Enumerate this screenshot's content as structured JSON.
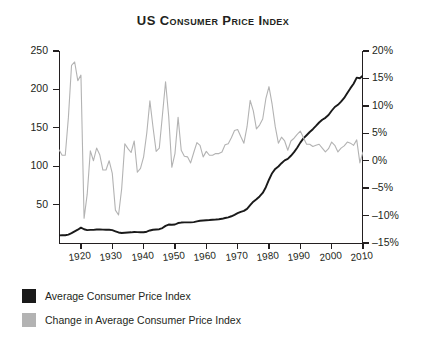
{
  "chart_data": {
    "type": "line",
    "title": "US Consumer Price Index",
    "xlabel": "",
    "ylabel": "",
    "grid": false,
    "legend_position": "bottom-left",
    "x": [
      1913,
      1914,
      1915,
      1916,
      1917,
      1918,
      1919,
      1920,
      1921,
      1922,
      1923,
      1924,
      1925,
      1926,
      1927,
      1928,
      1929,
      1930,
      1931,
      1932,
      1933,
      1934,
      1935,
      1936,
      1937,
      1938,
      1939,
      1940,
      1941,
      1942,
      1943,
      1944,
      1945,
      1946,
      1947,
      1948,
      1949,
      1950,
      1951,
      1952,
      1953,
      1954,
      1955,
      1956,
      1957,
      1958,
      1959,
      1960,
      1961,
      1962,
      1963,
      1964,
      1965,
      1966,
      1967,
      1968,
      1969,
      1970,
      1971,
      1972,
      1973,
      1974,
      1975,
      1976,
      1977,
      1978,
      1979,
      1980,
      1981,
      1982,
      1983,
      1984,
      1985,
      1986,
      1987,
      1988,
      1989,
      1990,
      1991,
      1992,
      1993,
      1994,
      1995,
      1996,
      1997,
      1998,
      1999,
      2000,
      2001,
      2002,
      2003,
      2004,
      2005,
      2006,
      2007,
      2008,
      2009,
      2010
    ],
    "xlim": [
      1913,
      2010
    ],
    "xticks": [
      1920,
      1930,
      1940,
      1950,
      1960,
      1970,
      1980,
      1990,
      2000,
      2010
    ],
    "xticklabels": [
      "1920",
      "1930",
      "1940",
      "1950",
      "1960",
      "1970",
      "1980",
      "1990",
      "2000",
      "2010"
    ],
    "axes": [
      {
        "id": "left",
        "label": "Average Consumer Price Index",
        "ylim": [
          0,
          250
        ],
        "yticks": [
          50,
          100,
          150,
          200,
          250
        ],
        "yticklabels": [
          "50",
          "100",
          "150",
          "200",
          "250"
        ]
      },
      {
        "id": "right",
        "label": "Change in Average Consumer Price Index",
        "ylim": [
          -15,
          20
        ],
        "yticks": [
          -15,
          -10,
          -5,
          0,
          5,
          10,
          15,
          20
        ],
        "yticklabels": [
          "-15%",
          "-10%",
          "-5%",
          "0%",
          "5%",
          "10%",
          "15%",
          "20%"
        ]
      }
    ],
    "series": [
      {
        "name": "Average Consumer Price Index",
        "axis": "left",
        "color": "#1a1a1a",
        "values": [
          9.9,
          10.0,
          10.1,
          10.9,
          12.8,
          15.1,
          17.3,
          20.0,
          17.9,
          16.8,
          17.1,
          17.1,
          17.5,
          17.7,
          17.4,
          17.2,
          17.2,
          16.7,
          15.2,
          13.7,
          13.0,
          13.4,
          13.7,
          13.9,
          14.4,
          14.1,
          13.9,
          14.0,
          14.7,
          16.3,
          17.3,
          17.6,
          18.0,
          19.5,
          22.3,
          24.0,
          23.8,
          24.1,
          26.0,
          26.6,
          26.8,
          26.9,
          26.8,
          27.2,
          28.1,
          28.9,
          29.2,
          29.6,
          29.9,
          30.3,
          30.6,
          31.0,
          31.5,
          32.5,
          33.4,
          34.8,
          36.7,
          38.8,
          40.5,
          41.8,
          44.4,
          49.3,
          53.8,
          56.9,
          60.6,
          65.2,
          72.6,
          82.4,
          90.9,
          96.5,
          99.6,
          103.9,
          107.6,
          109.6,
          113.6,
          118.3,
          124.0,
          130.7,
          136.2,
          140.3,
          144.5,
          148.2,
          152.4,
          156.9,
          160.5,
          163.0,
          166.6,
          172.2,
          177.1,
          179.9,
          184.0,
          188.9,
          195.3,
          201.6,
          207.3,
          215.3,
          214.5,
          218.1
        ]
      },
      {
        "name": "Change in Average Consumer Price Index",
        "axis": "right",
        "color": "#b3b3b3",
        "values": [
          2.0,
          1.0,
          1.0,
          7.9,
          17.4,
          18.0,
          14.6,
          15.6,
          -10.5,
          -6.1,
          1.8,
          0.0,
          2.3,
          1.1,
          -1.7,
          -1.7,
          0.0,
          -2.3,
          -9.0,
          -9.9,
          -5.1,
          3.1,
          2.2,
          1.5,
          3.6,
          -2.1,
          -1.4,
          0.7,
          5.0,
          10.9,
          6.1,
          1.7,
          2.3,
          8.3,
          14.4,
          8.1,
          -1.2,
          1.3,
          7.9,
          1.9,
          0.8,
          0.7,
          -0.4,
          1.5,
          3.3,
          2.8,
          0.7,
          1.7,
          1.0,
          1.0,
          1.3,
          1.3,
          1.6,
          2.9,
          3.1,
          4.2,
          5.5,
          5.7,
          4.4,
          3.2,
          6.2,
          11.0,
          9.1,
          5.8,
          6.5,
          7.6,
          11.3,
          13.5,
          10.3,
          6.2,
          3.2,
          4.3,
          3.6,
          1.9,
          3.6,
          4.1,
          4.8,
          5.4,
          4.2,
          3.0,
          3.0,
          2.6,
          2.8,
          3.0,
          2.3,
          1.6,
          2.2,
          3.4,
          2.8,
          1.6,
          2.3,
          2.7,
          3.4,
          3.2,
          2.8,
          3.8,
          -0.4,
          1.6
        ]
      }
    ]
  },
  "legend": {
    "items": [
      {
        "label": "Average Consumer Price Index",
        "color": "#1a1a1a"
      },
      {
        "label": "Change in Average Consumer Price Index",
        "color": "#b3b3b3"
      }
    ]
  }
}
